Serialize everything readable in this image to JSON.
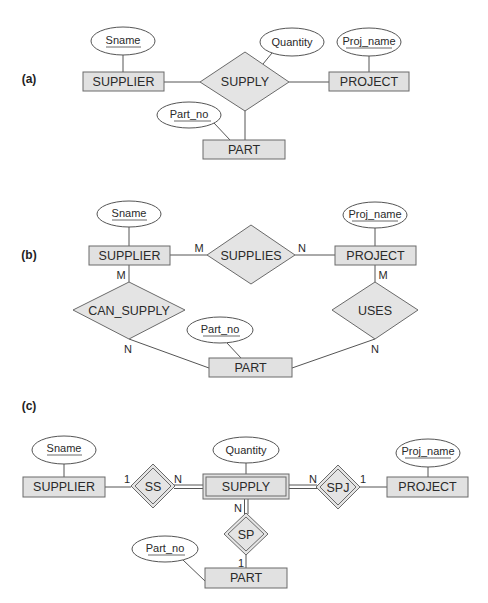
{
  "figure": {
    "colors": {
      "entity_fill": "#e1e1e1",
      "relationship_fill": "#e4e4e4",
      "stroke": "#6a6a6a",
      "attribute_fill": "#ffffff"
    },
    "a": {
      "label": "(a)",
      "entities": {
        "supplier": "SUPPLIER",
        "project": "PROJECT",
        "part": "PART"
      },
      "relationships": {
        "supply": "SUPPLY"
      },
      "attributes": {
        "sname": "Sname",
        "quantity": "Quantity",
        "proj_name": "Proj_name",
        "part_no": "Part_no"
      }
    },
    "b": {
      "label": "(b)",
      "entities": {
        "supplier": "SUPPLIER",
        "project": "PROJECT",
        "part": "PART"
      },
      "relationships": {
        "supplies": "SUPPLIES",
        "can_supply": "CAN_SUPPLY",
        "uses": "USES"
      },
      "attributes": {
        "sname": "Sname",
        "proj_name": "Proj_name",
        "part_no": "Part_no"
      },
      "cardinalities": {
        "supplier_supplies": "M",
        "supplies_project": "N",
        "supplier_can_supply": "M",
        "can_supply_part": "N",
        "project_uses": "M",
        "uses_part": "N"
      }
    },
    "c": {
      "label": "(c)",
      "entities": {
        "supplier": "SUPPLIER",
        "project": "PROJECT",
        "part": "PART"
      },
      "weak_entity": "SUPPLY",
      "identifying_relationships": {
        "ss": "SS",
        "spj": "SPJ",
        "sp": "SP"
      },
      "attributes": {
        "sname": "Sname",
        "quantity": "Quantity",
        "proj_name": "Proj_name",
        "part_no": "Part_no"
      },
      "cardinalities": {
        "supplier_ss": "1",
        "ss_supply": "N",
        "supply_spj": "N",
        "spj_project": "1",
        "supply_sp": "N",
        "sp_part": "1"
      }
    }
  }
}
